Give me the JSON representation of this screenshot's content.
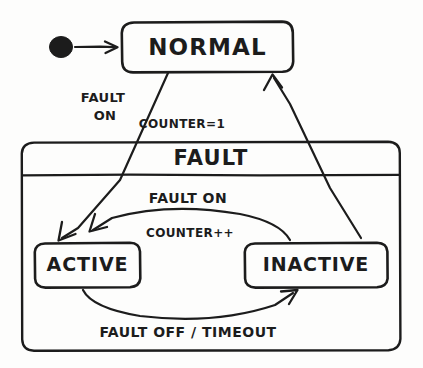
{
  "diagram": {
    "type": "uml-state-machine",
    "title_visible": false,
    "colors": {
      "stroke": "#1c1c1c",
      "background": "#fdfdfc"
    },
    "initial_state": {
      "name": "initial-pseudostate",
      "shape": "filled-circle"
    },
    "states": [
      {
        "id": "normal",
        "label": "NORMAL",
        "kind": "simple",
        "x": 122,
        "y": 22,
        "w": 171,
        "h": 50
      },
      {
        "id": "fault",
        "label": "FAULT",
        "kind": "composite",
        "x": 22,
        "y": 142,
        "w": 378,
        "h": 208
      },
      {
        "id": "active",
        "label": "ACTIVE",
        "kind": "simple",
        "parent": "fault",
        "x": 35,
        "y": 243,
        "w": 105,
        "h": 44
      },
      {
        "id": "inactive",
        "label": "INACTIVE",
        "kind": "simple",
        "parent": "fault",
        "x": 245,
        "y": 243,
        "w": 142,
        "h": 44
      }
    ],
    "transitions": [
      {
        "id": "init-to-normal",
        "from": "initial-pseudostate",
        "to": "normal",
        "label": "",
        "guard": "",
        "action": ""
      },
      {
        "id": "normal-to-active",
        "from": "normal",
        "to": "active",
        "trigger": "FAULT ON",
        "trigger_line1": "FAULT",
        "trigger_line2": "ON",
        "action": "COUNTER=1"
      },
      {
        "id": "inactive-to-active",
        "from": "inactive",
        "to": "active",
        "trigger": "FAULT ON",
        "action": "COUNTER++"
      },
      {
        "id": "active-to-inactive",
        "from": "active",
        "to": "inactive",
        "trigger": "FAULT OFF / TIMEOUT",
        "trigger_part1": "FAULT OFF",
        "separator": "/",
        "trigger_part2": "TIMEOUT"
      },
      {
        "id": "inactive-to-normal",
        "from": "inactive",
        "to": "normal",
        "trigger": "",
        "action": ""
      }
    ],
    "labels": {
      "normal": "NORMAL",
      "fault": "FAULT",
      "active": "ACTIVE",
      "inactive": "INACTIVE",
      "fault_on_upper_l1": "FAULT",
      "fault_on_upper_l2": "ON",
      "counter_eq_1": "COUNTER=1",
      "fault_on_inner": "FAULT ON",
      "counter_pp": "COUNTER++",
      "fault_off_timeout": "FAULT OFF / TIMEOUT"
    }
  }
}
